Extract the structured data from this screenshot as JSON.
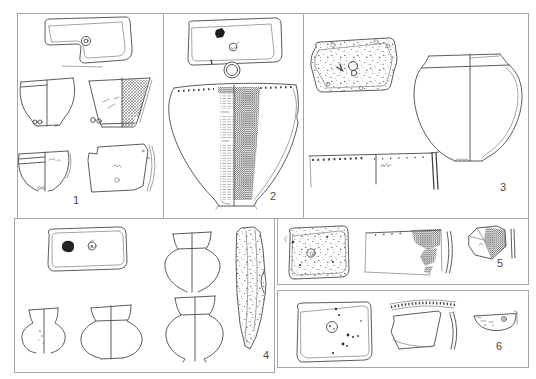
{
  "figure": {
    "panels": [
      {
        "label": "1"
      },
      {
        "label": "2"
      },
      {
        "label": "3"
      },
      {
        "label": "4"
      },
      {
        "label": "5"
      },
      {
        "label": "6"
      }
    ],
    "colors": {
      "ink": "#4a4a4a",
      "panel_border": "#a6a6a6",
      "background": "#ffffff"
    }
  }
}
